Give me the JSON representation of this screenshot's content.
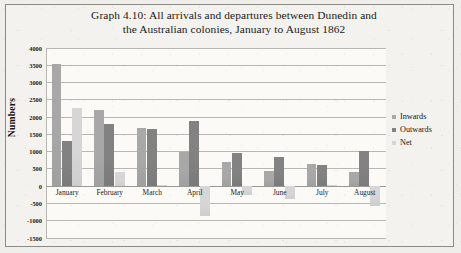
{
  "title": {
    "line1": "Graph 4.10: All arrivals and departures between Dunedin and",
    "line2": "the Australian colonies, January to August 1862"
  },
  "legend": {
    "position": "right",
    "items": [
      {
        "label": "Inwards",
        "color": "#a8a8a8"
      },
      {
        "label": "Outwards",
        "color": "#828282"
      },
      {
        "label": "Net",
        "color": "#d6d6d6"
      }
    ]
  },
  "axis": {
    "ylabel": "Numbers",
    "yticks": [
      "4000",
      "3500",
      "3000",
      "2500",
      "2000",
      "1500",
      "1000",
      "500",
      "0",
      "-500",
      "-1000",
      "-1500"
    ]
  },
  "chart_data": {
    "type": "bar",
    "title": "Graph 4.10: All arrivals and departures between Dunedin and the Australian colonies, January to August 1862",
    "xlabel": "",
    "ylabel": "Numbers",
    "ylim": [
      -1500,
      4000
    ],
    "ystep": 500,
    "grid": true,
    "legend_position": "right",
    "categories": [
      "January",
      "February",
      "March",
      "April",
      "May",
      "June",
      "July",
      "August"
    ],
    "series": [
      {
        "name": "Inwards",
        "color": "#a8a8a8",
        "values": [
          3530,
          2190,
          1660,
          980,
          700,
          430,
          620,
          400
        ]
      },
      {
        "name": "Outwards",
        "color": "#828282",
        "values": [
          1290,
          1800,
          1640,
          1870,
          960,
          830,
          600,
          1000
        ]
      },
      {
        "name": "Net",
        "color": "#d6d6d6",
        "values": [
          2240,
          390,
          20,
          -890,
          -260,
          -400,
          20,
          -600
        ]
      }
    ]
  }
}
